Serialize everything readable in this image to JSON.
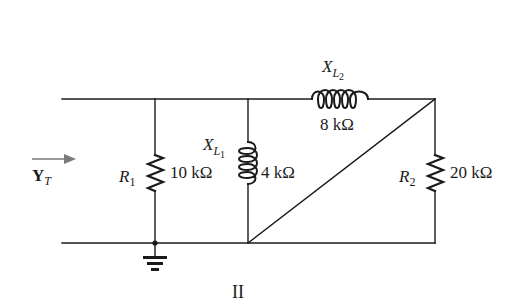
{
  "diagram": {
    "type": "circuit",
    "caption": "II",
    "input": {
      "symbol": "Y",
      "subscript": "T",
      "direction": "right"
    },
    "components": [
      {
        "id": "R1",
        "kind": "resistor",
        "symbol": "R",
        "subscript": "1",
        "value": "10 kΩ",
        "orientation": "vertical",
        "connects": [
          "top",
          "bottom"
        ]
      },
      {
        "id": "XL1",
        "kind": "inductor",
        "symbol": "X",
        "subscript": "L",
        "sub_subscript": "1",
        "value": "4 kΩ",
        "orientation": "vertical",
        "connects": [
          "top",
          "bottom"
        ]
      },
      {
        "id": "XL2",
        "kind": "inductor",
        "symbol": "X",
        "subscript": "L",
        "sub_subscript": "2",
        "value": "8 kΩ",
        "orientation": "horizontal",
        "connects": [
          "top-mid",
          "top-right"
        ]
      },
      {
        "id": "R2",
        "kind": "resistor",
        "symbol": "R",
        "subscript": "2",
        "value": "20 kΩ",
        "orientation": "vertical",
        "connects": [
          "top-right",
          "bottom"
        ]
      }
    ],
    "wires": [
      {
        "id": "short-diagonal",
        "from": "bottom-at-XL1",
        "to": "top-right"
      }
    ],
    "ground": {
      "node": "bottom-at-R1"
    },
    "colors": {
      "line": "#1a1a1a",
      "arrow": "#7a7a7a",
      "background": "#ffffff"
    }
  }
}
